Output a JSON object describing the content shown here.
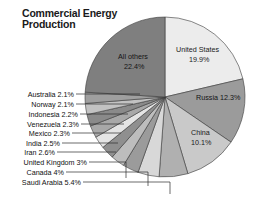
{
  "title": {
    "line1": "Commercial Energy",
    "line2": "Production"
  },
  "chart_data": {
    "type": "pie",
    "title": "Commercial Energy Production",
    "xlabel": "",
    "ylabel": "",
    "legend_position": "none",
    "grid": false,
    "start_angle_deg": 0,
    "direction": "clockwise",
    "categories": [
      "United States",
      "Russia",
      "China",
      "Saudi Arabia",
      "Canada",
      "United Kingdom",
      "Iran",
      "India",
      "Mexico",
      "Venezuela",
      "Indonesia",
      "Norway",
      "Australia",
      "All others"
    ],
    "values": [
      19.9,
      12.3,
      10.1,
      5.4,
      4.0,
      3.0,
      2.6,
      2.5,
      2.3,
      2.3,
      2.2,
      2.1,
      2.1,
      22.4
    ],
    "value_unit": "%",
    "colors": [
      "#ececec",
      "#9b9b9b",
      "#c9c9c9",
      "#b0b0b0",
      "#d8d8d8",
      "#9b9b9b",
      "#bdbdbd",
      "#8f8f8f",
      "#e4e4e4",
      "#a8a8a8",
      "#8a8a8a",
      "#c2c2c2",
      "#9f9f9f",
      "#7f7f7f"
    ],
    "inside_labels": [
      {
        "name": "United States",
        "text_line1": "United States",
        "text_line2": "19.9%"
      },
      {
        "name": "Russia",
        "text_line1": "Russia 12.3%",
        "text_line2": ""
      },
      {
        "name": "China",
        "text_line1": "China",
        "text_line2": "10.1%"
      },
      {
        "name": "All others",
        "text_line1": "All others",
        "text_line2": "22.4%"
      }
    ],
    "callout_labels": [
      {
        "name": "Australia",
        "text": "Australia 2.1%"
      },
      {
        "name": "Norway",
        "text": "Norway 2.1%"
      },
      {
        "name": "Indonesia",
        "text": "Indonesia 2.2%"
      },
      {
        "name": "Venezuela",
        "text": "Venezuela 2.3%"
      },
      {
        "name": "Mexico",
        "text": "Mexico 2.3%"
      },
      {
        "name": "India",
        "text": "India 2.5%"
      },
      {
        "name": "Iran",
        "text": "Iran 2.6%"
      },
      {
        "name": "United Kingdom",
        "text": "United Kingdom 3%"
      },
      {
        "name": "Canada",
        "text": "Canada 4%"
      },
      {
        "name": "Saudi Arabia",
        "text": "Saudi Arabia 5.4%"
      }
    ]
  },
  "labels": {
    "united_states_l1": "United States",
    "united_states_l2": "19.9%",
    "russia": "Russia 12.3%",
    "china_l1": "China",
    "china_l2": "10.1%",
    "all_others_l1": "All others",
    "all_others_l2": "22.4%",
    "australia": "Australia 2.1%",
    "norway": "Norway 2.1%",
    "indonesia": "Indonesia 2.2%",
    "venezuela": "Venezuela 2.3%",
    "mexico": "Mexico 2.3%",
    "india": "India 2.5%",
    "iran": "Iran 2.6%",
    "united_kingdom": "United Kingdom 3%",
    "canada": "Canada 4%",
    "saudi_arabia": "Saudi Arabia 5.4%"
  }
}
